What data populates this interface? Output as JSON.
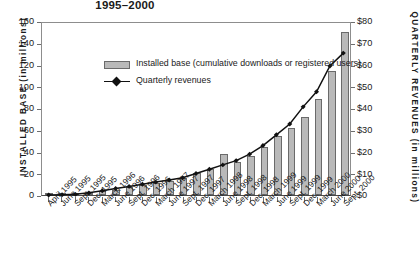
{
  "title": "1995–2000",
  "legend": {
    "bar_label": "Installed base (cumulative downloads or registered users)",
    "line_label": "Quarterly revenues"
  },
  "axes": {
    "left_title": "INSTALLED BASE (in millions)",
    "right_title": "QUARTERLY REVENUES (in millions)",
    "left_ticks": [
      "160",
      "140",
      "120",
      "100",
      "80",
      "60",
      "40",
      "20",
      "0"
    ],
    "right_ticks": [
      "$80",
      "$70",
      "$60",
      "$50",
      "$40",
      "$30",
      "$20",
      "$10",
      "$0"
    ]
  },
  "chart_data": {
    "type": "bar",
    "title": "1995–2000",
    "xlabel": "",
    "ylabel": "INSTALLED BASE (in millions)",
    "y2label": "QUARTERLY REVENUES (in millions)",
    "ylim": [
      0,
      160
    ],
    "y2lim": [
      0,
      80
    ],
    "grid": false,
    "legend_position": "upper-left-inside",
    "categories": [
      "April 1995",
      "June 1995",
      "Sept. 1995",
      "Dec. 1995",
      "March 1996",
      "June 1996",
      "Sept. 1996",
      "Dec. 1996",
      "March 1997",
      "June 1997",
      "Sept. 1997",
      "Dec. 1997",
      "March 1998",
      "June 1998",
      "Sept. 1998",
      "Dec. 1998",
      "March 1999",
      "June 1999",
      "Sept. 1999",
      "Dec. 1999",
      "March 2000",
      "June 2000",
      "Sept. 2000"
    ],
    "series": [
      {
        "name": "Installed base (cumulative downloads or registered users)",
        "type": "bar",
        "axis": "left",
        "unit": "millions",
        "values": [
          0,
          0.2,
          1,
          2,
          4,
          5,
          7,
          9,
          11,
          13,
          16,
          20,
          24,
          38,
          30,
          36,
          44,
          54,
          62,
          72,
          88,
          114,
          150
        ]
      },
      {
        "name": "Quarterly revenues",
        "type": "line",
        "axis": "right",
        "unit": "$ millions",
        "marker": "diamond",
        "values": [
          0,
          0.1,
          0.3,
          1,
          2,
          3,
          4,
          5,
          6,
          7,
          8,
          10,
          12,
          14,
          16,
          19,
          23,
          28,
          33,
          41,
          48,
          60,
          66
        ]
      }
    ]
  }
}
